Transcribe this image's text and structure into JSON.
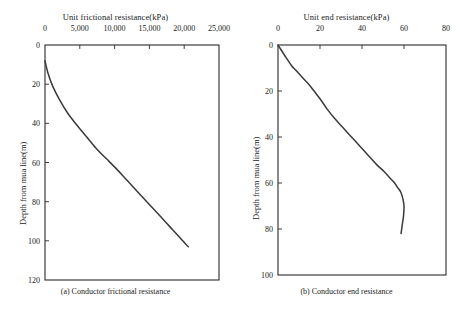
{
  "figure": {
    "panels": [
      {
        "id": "panel-a",
        "caption": "(a) Conductor frictional resistance",
        "x_axis_title": "Unit frictional resistance(kPa)",
        "y_axis_title": "Depth from mua line(m)",
        "x_ticks": [
          "0",
          "5,000",
          "10,000",
          "15,000",
          "20,000",
          "25,000"
        ],
        "y_ticks": [
          "0",
          "20",
          "40",
          "60",
          "80",
          "100",
          "120"
        ]
      },
      {
        "id": "panel-b",
        "caption": "(b) Conductor end resistance",
        "x_axis_title": "Unit end resistance(kPa)",
        "y_axis_title": "Depth from mua line(m)",
        "x_ticks": [
          "0",
          "20",
          "40",
          "60",
          "80"
        ],
        "y_ticks": [
          "0",
          "20",
          "40",
          "60",
          "80",
          "100"
        ]
      }
    ]
  },
  "chart_data": [
    {
      "type": "line",
      "title": "(a) Conductor frictional resistance",
      "xlabel": "Unit frictional resistance(kPa)",
      "ylabel": "Depth from mua line(m)",
      "xlim": [
        0,
        25000
      ],
      "ylim": [
        0,
        120
      ],
      "y_inverted": true,
      "x_axis_position": "top",
      "grid": false,
      "legend": "none",
      "xticks": [
        0,
        5000,
        10000,
        15000,
        20000,
        25000
      ],
      "yticks": [
        0,
        20,
        40,
        60,
        80,
        100,
        120
      ],
      "series": [
        {
          "name": "Unit frictional resistance profile",
          "x": [
            0,
            400,
            1100,
            2100,
            3300,
            4600,
            6000,
            7400,
            8800,
            10200,
            11500,
            12800,
            14100,
            15400,
            16700,
            18000,
            19300,
            20300,
            20600
          ],
          "y": [
            8,
            14,
            21,
            28,
            35,
            41,
            47,
            53,
            58,
            63,
            68,
            73,
            78,
            83,
            88,
            93,
            98,
            102,
            103
          ]
        }
      ]
    },
    {
      "type": "line",
      "title": "(b) Conductor end resistance",
      "xlabel": "Unit end resistance(kPa)",
      "ylabel": "Depth from mua line(m)",
      "xlim": [
        0,
        80
      ],
      "ylim": [
        0,
        100
      ],
      "y_inverted": true,
      "x_axis_position": "top",
      "grid": false,
      "legend": "none",
      "xticks": [
        0,
        20,
        40,
        60,
        80
      ],
      "yticks": [
        0,
        20,
        40,
        60,
        80,
        100
      ],
      "series": [
        {
          "name": "Unit end resistance profile",
          "x": [
            0,
            3.5,
            6.5,
            8.5,
            12.5,
            15.5,
            18.0,
            20.5,
            23.5,
            27.0,
            31.0,
            35.0,
            39.0,
            43.0,
            47.0,
            50.5,
            53.5,
            55.5,
            57.0,
            58.5,
            59.5,
            60.0,
            59.8,
            59.2,
            58.6
          ],
          "y": [
            0,
            5,
            9,
            11,
            15,
            18,
            21,
            24,
            28,
            32,
            36,
            40,
            44,
            48,
            52,
            55,
            58,
            60,
            62,
            64,
            67,
            70,
            74,
            78,
            82
          ]
        }
      ]
    }
  ],
  "colors": {
    "curve": "#3a3a3a",
    "axis": "#2b2b2b",
    "background": "#ffffff"
  }
}
